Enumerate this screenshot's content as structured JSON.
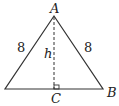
{
  "diagram": {
    "type": "isosceles-triangle",
    "vertices": {
      "apex": "A",
      "right": "B",
      "foot": "C"
    },
    "labels": {
      "A": "A",
      "B": "B",
      "C": "C",
      "h": "h",
      "left_side": "8",
      "right_side": "8"
    },
    "colors": {
      "stroke": "#333333"
    }
  }
}
